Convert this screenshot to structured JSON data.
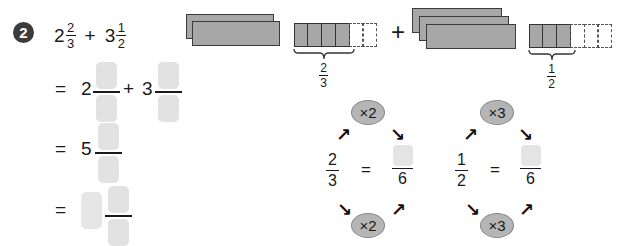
{
  "problem": {
    "number": "2",
    "expression": {
      "term1": {
        "whole": "2",
        "numerator": "2",
        "denominator": "3"
      },
      "operator": "+",
      "term2": {
        "whole": "3",
        "numerator": "1",
        "denominator": "2"
      }
    },
    "steps": [
      {
        "equals": "=",
        "whole1": "2",
        "operator": "+",
        "whole2": "3",
        "blanks": [
          "numerator",
          "denominator",
          "numerator",
          "denominator"
        ]
      },
      {
        "equals": "=",
        "whole": "5",
        "blanks": [
          "numerator",
          "denominator"
        ]
      },
      {
        "equals": "=",
        "blanks": [
          "whole",
          "numerator",
          "denominator"
        ]
      }
    ]
  },
  "diagram": {
    "plus": "+",
    "group1": {
      "whole_bars": 2,
      "filled_cells": 4,
      "empty_cells": 2,
      "label": {
        "numerator": "2",
        "denominator": "3"
      }
    },
    "group2": {
      "whole_bars": 3,
      "filled_cells": 3,
      "empty_cells": 3,
      "label": {
        "numerator": "1",
        "denominator": "2"
      }
    },
    "fill_color": "#a7a7a7"
  },
  "equivalence": [
    {
      "multiplier_top": "×2",
      "multiplier_bottom": "×2",
      "numerator": "2",
      "denominator": "3",
      "equals": "=",
      "target_denominator": "6"
    },
    {
      "multiplier_top": "×3",
      "multiplier_bottom": "×3",
      "numerator": "1",
      "denominator": "2",
      "equals": "=",
      "target_denominator": "6"
    }
  ],
  "icons": {
    "arrow_up_right": "↗",
    "arrow_down_right": "↘"
  }
}
